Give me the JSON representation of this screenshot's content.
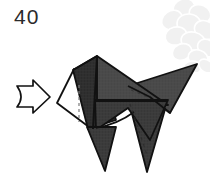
{
  "diagram": {
    "kind": "origami-instruction-step",
    "step_number": "40",
    "background_color": "#ffffff",
    "paper": {
      "front_color": "#4a4a4a",
      "front_shade_dark": "#3a3a3a",
      "front_shade_darker": "#2e2e2e",
      "back_color": "#ffffff",
      "outline_color": "#111111",
      "outline_width": 2.0,
      "crease_color": "#2a2a2a",
      "hidden_crease_style": "dashed"
    },
    "watermark": {
      "name": "floral-petal-watermark",
      "color": "#f2f2f2",
      "position": "top-right"
    },
    "action_arrow": {
      "name": "push-arrow",
      "label": "",
      "direction": "right",
      "style": "hollow-outline",
      "fill": "#ffffff",
      "stroke": "#111111",
      "x": 16,
      "y": 83,
      "width": 36,
      "height": 28
    },
    "shapes": {
      "head_panel": "M 97,57 L 72,71 L 92,128 L 118,112 Z",
      "body_panel": "M 97,57 L 166,106 L 110,108 Z",
      "tail_panel": "M 131,88 L 196,66 L 171,112 Z",
      "white_flap": "M 72,71 L 58,102 L 92,128 Z",
      "front_leg": "M 86,128 L 113,128 L 105,171 Z",
      "hind_leg": "M 133,110 L 163,110 L 146,172 Z"
    },
    "creases": [
      {
        "name": "vertical-hidden-crease",
        "from": [
          78,
          86
        ],
        "to": [
          78,
          120
        ],
        "hidden": true
      },
      {
        "name": "body-fold-line",
        "from": [
          97,
          57
        ],
        "to": [
          92,
          128
        ],
        "hidden": false
      },
      {
        "name": "horizontal-spine",
        "from": [
          92,
          100
        ],
        "to": [
          166,
          100
        ],
        "hidden": false
      },
      {
        "name": "leg-crease",
        "from": [
          131,
          104
        ],
        "to": [
          146,
          150
        ],
        "hidden": true
      },
      {
        "name": "chest-curve",
        "from": [
          95,
          128
        ],
        "to": [
          135,
          118
        ],
        "hidden": false
      }
    ]
  }
}
